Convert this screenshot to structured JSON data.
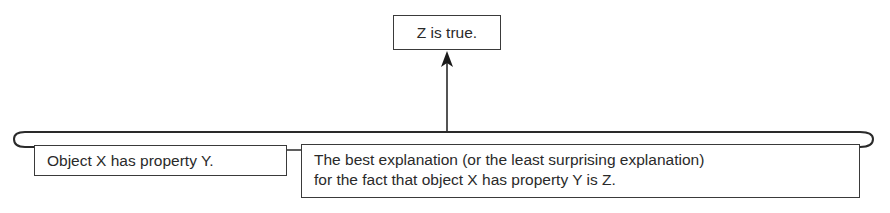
{
  "diagram": {
    "type": "argument-structure",
    "conclusion": {
      "text": "Z is true."
    },
    "premises": [
      {
        "text": "Object X has property Y."
      },
      {
        "text": "The best explanation (or the least surprising explanation) for the fact that object X has property Y is Z.",
        "lines": [
          "The best explanation (or the least surprising explanation)",
          "for the fact that object X has property Y is Z."
        ]
      }
    ],
    "connections": [
      {
        "from": "premises",
        "to": "conclusion",
        "style": "bracket-with-arrow"
      }
    ],
    "colors": {
      "line": "#2a2a2a",
      "background": "#ffffff",
      "text": "#2a2a2a"
    }
  }
}
